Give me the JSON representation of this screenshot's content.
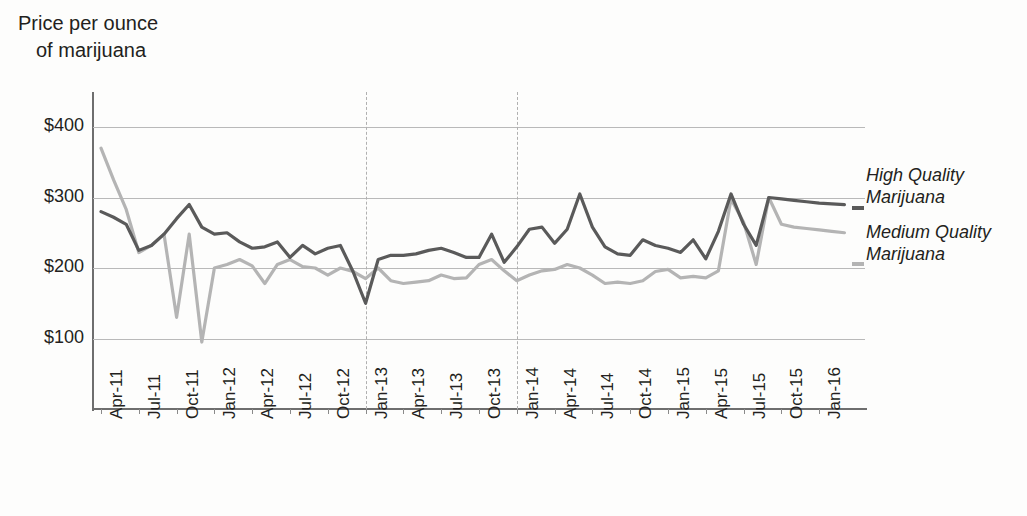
{
  "title": {
    "line1": "Price per ounce",
    "line2": "of marijuana"
  },
  "legend": {
    "high": "High Quality\nMarijuana",
    "high_line1": "High Quality",
    "high_line2": "Marijuana",
    "medium_line1": "Medium Quality",
    "medium_line2": "Marijuana",
    "high_color": "#5a5a5a",
    "medium_color": "#b4b4b4"
  },
  "axis": {
    "y_ticks": [
      "$400",
      "$300",
      "$200",
      "$100"
    ],
    "y_values": [
      400,
      300,
      200,
      100
    ],
    "x_ticks": [
      "Apr-11",
      "Jul-11",
      "Oct-11",
      "Jan-12",
      "Apr-12",
      "Jul-12",
      "Oct-12",
      "Jan-13",
      "Apr-13",
      "Jul-13",
      "Oct-13",
      "Jan-14",
      "Apr-14",
      "Jul-14",
      "Oct-14",
      "Jan-15",
      "Apr-15",
      "Jul-15",
      "Oct-15",
      "Jan-16"
    ],
    "reference_lines": [
      "Jan-13",
      "Jan-14"
    ]
  },
  "chart_data": {
    "type": "line",
    "title": "Price per ounce of marijuana",
    "xlabel": "",
    "ylabel": "Price per ounce of marijuana",
    "ylim": [
      0,
      430
    ],
    "grid": true,
    "legend_position": "right",
    "x": [
      "Apr-11",
      "May-11",
      "Jun-11",
      "Jul-11",
      "Aug-11",
      "Sep-11",
      "Oct-11",
      "Nov-11",
      "Dec-11",
      "Jan-12",
      "Feb-12",
      "Mar-12",
      "Apr-12",
      "May-12",
      "Jun-12",
      "Jul-12",
      "Aug-12",
      "Sep-12",
      "Oct-12",
      "Nov-12",
      "Dec-12",
      "Jan-13",
      "Feb-13",
      "Mar-13",
      "Apr-13",
      "May-13",
      "Jun-13",
      "Jul-13",
      "Aug-13",
      "Sep-13",
      "Oct-13",
      "Nov-13",
      "Dec-13",
      "Jan-14",
      "Feb-14",
      "Mar-14",
      "Apr-14",
      "May-14",
      "Jun-14",
      "Jul-14",
      "Aug-14",
      "Sep-14",
      "Oct-14",
      "Nov-14",
      "Dec-14",
      "Jan-15",
      "Feb-15",
      "Mar-15",
      "Apr-15",
      "May-15",
      "Jun-15",
      "Jul-15",
      "Aug-15",
      "Sep-15",
      "Oct-15",
      "Nov-15",
      "Dec-15",
      "Jan-16",
      "Feb-16",
      "Mar-16"
    ],
    "series": [
      {
        "name": "High Quality Marijuana",
        "color": "#5a5a5a",
        "values": [
          280,
          272,
          262,
          225,
          232,
          248,
          270,
          290,
          258,
          248,
          250,
          237,
          228,
          230,
          237,
          215,
          232,
          220,
          228,
          232,
          195,
          150,
          212,
          218,
          218,
          220,
          225,
          228,
          222,
          215,
          215,
          248,
          208,
          230,
          255,
          258,
          235,
          255,
          305,
          258,
          230,
          220,
          218,
          240,
          232,
          228,
          222,
          240,
          213,
          252,
          305,
          262,
          232,
          300,
          298,
          296,
          294,
          292,
          291,
          290
        ]
      },
      {
        "name": "Medium Quality Marijuana",
        "color": "#b4b4b4",
        "values": [
          370,
          325,
          283,
          222,
          232,
          248,
          130,
          248,
          95,
          200,
          205,
          212,
          203,
          178,
          205,
          212,
          202,
          200,
          190,
          200,
          195,
          185,
          200,
          182,
          178,
          180,
          182,
          190,
          185,
          186,
          205,
          212,
          196,
          182,
          190,
          196,
          198,
          205,
          200,
          190,
          178,
          180,
          178,
          182,
          195,
          198,
          186,
          188,
          186,
          196,
          298,
          265,
          205,
          300,
          262,
          258,
          256,
          254,
          252,
          250
        ]
      }
    ]
  }
}
